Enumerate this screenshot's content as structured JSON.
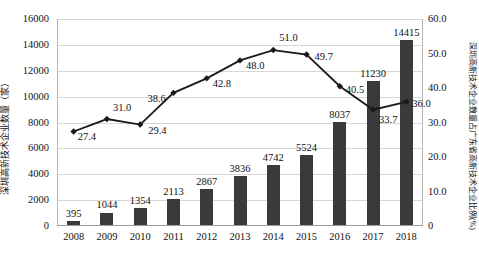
{
  "chart_data": {
    "type": "bar",
    "title": "",
    "categories": [
      "2008",
      "2009",
      "2010",
      "2011",
      "2012",
      "2013",
      "2014",
      "2015",
      "2016",
      "2017",
      "2018"
    ],
    "xlabel": "",
    "ylabel": "深圳高新技术企业数量（家）",
    "y2label": "深圳高新技术企业数量占广东省高新技术企业比例(%)",
    "ylim": [
      0,
      16000
    ],
    "y2lim": [
      0,
      60
    ],
    "grid": true,
    "legend": "none",
    "series": [
      {
        "name": "深圳高新技术企业数量（家）",
        "type": "bar",
        "axis": "left",
        "color": "#3a3a3a",
        "values": [
          395,
          1044,
          1354,
          2113,
          2867,
          3836,
          4742,
          5524,
          8037,
          11230,
          14415
        ],
        "labels": [
          "395",
          "1044",
          "1354",
          "2113",
          "2867",
          "3836",
          "4742",
          "5524",
          "8037",
          "11230",
          "14415"
        ]
      },
      {
        "name": "深圳高新技术企业数量占广东省高新技术企业比例(%)",
        "type": "line",
        "axis": "right",
        "color": "#1a1a1a",
        "values": [
          27.4,
          31.0,
          29.4,
          38.6,
          42.8,
          48.0,
          51.0,
          49.7,
          40.5,
          33.7,
          36.0
        ],
        "labels": [
          "27.4",
          "31.0",
          "29.4",
          "38.6",
          "42.8",
          "48.0",
          "51.0",
          "49.7",
          "40.5",
          "33.7",
          "36.0"
        ]
      }
    ],
    "y_ticks": [
      "16000",
      "14000",
      "12000",
      "10000",
      "8000",
      "6000",
      "4000",
      "2000",
      "0"
    ],
    "y_tick_values": [
      16000,
      14000,
      12000,
      10000,
      8000,
      6000,
      4000,
      2000,
      0
    ],
    "y2_ticks": [
      "60.0",
      "50.0",
      "40.0",
      "30.0",
      "20.0",
      "10.0",
      "0"
    ],
    "y2_tick_values": [
      60,
      50,
      40,
      30,
      20,
      10,
      0
    ]
  }
}
